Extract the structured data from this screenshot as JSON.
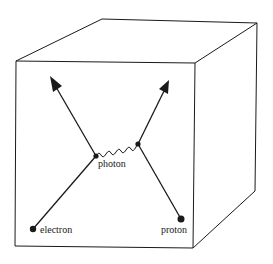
{
  "diagram": {
    "labels": {
      "photon": "photon",
      "electron": "electron",
      "proton": "proton"
    },
    "colors": {
      "line": "#1a1a1a",
      "background": "#ffffff"
    },
    "elements": [
      {
        "type": "box-3d",
        "description": "wireframe cube"
      },
      {
        "type": "particle",
        "name": "electron",
        "position": "bottom-left"
      },
      {
        "type": "particle",
        "name": "proton",
        "position": "bottom-right"
      },
      {
        "type": "vertex",
        "name": "left-vertex"
      },
      {
        "type": "vertex",
        "name": "right-vertex"
      },
      {
        "type": "propagator",
        "name": "photon",
        "style": "wavy"
      },
      {
        "type": "arrow",
        "name": "outgoing-electron",
        "direction": "up-left"
      },
      {
        "type": "arrow",
        "name": "outgoing-proton",
        "direction": "up-right"
      }
    ]
  }
}
